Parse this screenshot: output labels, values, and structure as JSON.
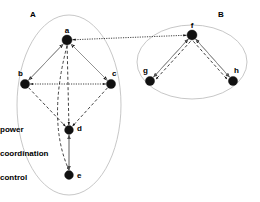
{
  "diagram": {
    "background_color": "#ffffff",
    "line_color": "#111111",
    "cluster_outline_color": "#b9b9b9",
    "clusters": [
      {
        "id": "A",
        "label": "A",
        "label_x": 30,
        "label_y": 17,
        "cx": 69,
        "cy": 105,
        "rx": 52,
        "ry": 90
      },
      {
        "id": "B",
        "label": "B",
        "label_x": 218,
        "label_y": 17,
        "cx": 192,
        "cy": 62,
        "rx": 55,
        "ry": 37
      }
    ],
    "nodes": [
      {
        "id": "a",
        "label": "a",
        "cluster": "A",
        "x": 67,
        "y": 40,
        "r": 5.0,
        "label_dx": 0,
        "label_dy": -7
      },
      {
        "id": "b",
        "label": "b",
        "cluster": "A",
        "x": 25,
        "y": 84,
        "r": 4.6,
        "label_dx": -2,
        "label_dy": -8
      },
      {
        "id": "c",
        "label": "c",
        "cluster": "A",
        "x": 111,
        "y": 84,
        "r": 4.6,
        "label_dx": 1,
        "label_dy": -8
      },
      {
        "id": "d",
        "label": "d",
        "cluster": "A",
        "x": 69,
        "y": 130,
        "r": 4.4,
        "label_dx": 8,
        "label_dy": 1
      },
      {
        "id": "e",
        "label": "e",
        "cluster": "A",
        "x": 69,
        "y": 175,
        "r": 4.4,
        "label_dx": 8,
        "label_dy": 3
      },
      {
        "id": "f",
        "label": "f",
        "cluster": "B",
        "x": 192,
        "y": 35,
        "r": 5.0,
        "label_dx": 0,
        "label_dy": -7
      },
      {
        "id": "g",
        "label": "g",
        "cluster": "B",
        "x": 150,
        "y": 81,
        "r": 4.6,
        "label_dx": -2,
        "label_dy": -8
      },
      {
        "id": "h",
        "label": "h",
        "cluster": "B",
        "x": 233,
        "y": 81,
        "r": 4.6,
        "label_dx": 1,
        "label_dy": -8
      }
    ],
    "edges": [
      {
        "from": "a",
        "to": "b",
        "type": "power",
        "arrows": "both",
        "offset": 0
      },
      {
        "from": "a",
        "to": "c",
        "type": "power",
        "arrows": "both",
        "offset": 0
      },
      {
        "from": "b",
        "to": "c",
        "type": "coordination",
        "arrows": "both",
        "offset": 0
      },
      {
        "from": "a",
        "to": "f",
        "type": "coordination",
        "arrows": "both",
        "offset": 0
      },
      {
        "from": "b",
        "to": "d",
        "type": "control",
        "arrows": "end",
        "offset": 0
      },
      {
        "from": "c",
        "to": "d",
        "type": "control",
        "arrows": "end",
        "offset": 0
      },
      {
        "from": "a",
        "to": "d",
        "type": "control",
        "arrows": "end",
        "offset": 0
      },
      {
        "from": "a",
        "to": "e",
        "type": "control",
        "arrows": "end",
        "offset": 0
      },
      {
        "from": "d",
        "to": "e",
        "type": "power",
        "arrows": "both",
        "offset": 0
      },
      {
        "from": "f",
        "to": "g",
        "type": "power",
        "arrows": "both",
        "offset": 0
      },
      {
        "from": "f",
        "to": "h",
        "type": "power",
        "arrows": "both",
        "offset": 0
      },
      {
        "from": "f",
        "to": "g",
        "type": "control",
        "arrows": "end",
        "offset": -3.2
      },
      {
        "from": "f",
        "to": "h",
        "type": "control",
        "arrows": "end",
        "offset": 3.2
      }
    ]
  },
  "legend": {
    "x": 158,
    "items": [
      {
        "key": "power",
        "label": "power",
        "label_y": 132,
        "line_y": 140,
        "x1": 158,
        "x2": 238
      },
      {
        "key": "coordination",
        "label": "coordination",
        "label_y": 156,
        "line_y": 164,
        "x1": 158,
        "x2": 238
      },
      {
        "key": "control",
        "label": "control",
        "label_y": 180,
        "line_y": 188,
        "x1": 158,
        "x2": 238
      }
    ]
  }
}
